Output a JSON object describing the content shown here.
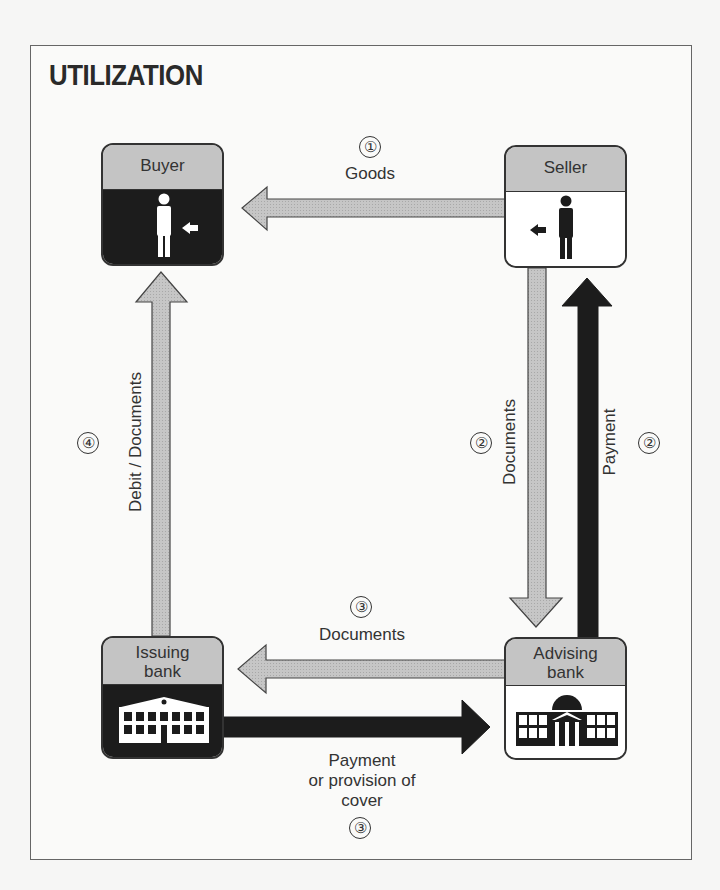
{
  "title": "UTILIZATION",
  "nodes": {
    "buyer": {
      "label": "Buyer",
      "icon": "person-icon"
    },
    "seller": {
      "label": "Seller",
      "icon": "person-icon"
    },
    "issuing_bank": {
      "label_line1": "Issuing",
      "label_line2": "bank",
      "icon": "bank-building-icon"
    },
    "advising_bank": {
      "label_line1": "Advising",
      "label_line2": "bank",
      "icon": "bank-building-domed-icon"
    }
  },
  "flows": [
    {
      "step": "①",
      "label": "Goods",
      "from": "Seller",
      "to": "Buyer",
      "style": "gray"
    },
    {
      "step": "②",
      "label": "Documents",
      "from": "Seller",
      "to": "Advising bank",
      "style": "gray"
    },
    {
      "step": "②",
      "label": "Payment",
      "from": "Advising bank",
      "to": "Seller",
      "style": "black"
    },
    {
      "step": "③",
      "label": "Documents",
      "from": "Advising bank",
      "to": "Issuing bank",
      "style": "gray"
    },
    {
      "step": "③",
      "label_line1": "Payment",
      "label_line2": "or provision of",
      "label_line3": "cover",
      "from": "Issuing bank",
      "to": "Advising bank",
      "style": "black"
    },
    {
      "step": "④",
      "label": "Debit / Documents",
      "from": "Issuing bank",
      "to": "Buyer",
      "style": "gray"
    }
  ],
  "colors": {
    "gray_fill": "#c4c4c4",
    "black_fill": "#1c1c1c",
    "outline": "#333333"
  }
}
